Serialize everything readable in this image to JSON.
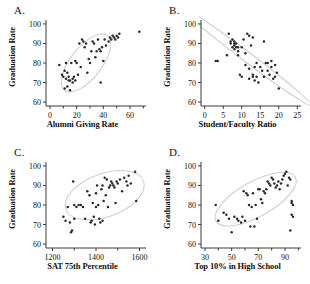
{
  "figure": {
    "width": 310,
    "height": 284,
    "background": "#ffffff",
    "point_color": "#2a2a2a",
    "axis_color": "#3a3a3a",
    "ellipse_color": "#cfcfcf"
  },
  "panels": [
    {
      "letter": "A.",
      "ylabel": "Graduation Rate",
      "xlabel": "Alumni Giving Rate"
    },
    {
      "letter": "B.",
      "ylabel": "Graduation Rate",
      "xlabel": "Student/Faculty Ratio"
    },
    {
      "letter": "C.",
      "ylabel": "Graduation Rate",
      "xlabel": "SAT 75th Percentile"
    },
    {
      "letter": "D.",
      "ylabel": "Graduation Rate",
      "xlabel": "Top 10% in High School"
    }
  ],
  "chart_data": [
    {
      "panel": "A",
      "type": "scatter",
      "title": "A.",
      "xlabel": "Alumni Giving Rate",
      "ylabel": "Graduation Rate",
      "xlim": [
        -3,
        72
      ],
      "ylim": [
        58,
        102
      ],
      "xticks": [
        0,
        20,
        40,
        60
      ],
      "xminorticks": [
        10,
        30,
        50,
        70
      ],
      "yticks": [
        60,
        70,
        80,
        90,
        100
      ],
      "grid": false,
      "legend": null,
      "annotation": "light gray confidence ellipse oriented positively",
      "ellipse": {
        "cx": 27,
        "cy": 80,
        "rx": 26,
        "ry": 8,
        "angle": -52
      },
      "x": [
        7,
        9,
        10,
        11,
        11,
        12,
        12,
        13,
        13,
        14,
        14,
        15,
        15,
        16,
        17,
        17,
        18,
        19,
        19,
        20,
        21,
        22,
        23,
        24,
        25,
        26,
        27,
        28,
        29,
        30,
        31,
        32,
        33,
        34,
        35,
        36,
        37,
        38,
        38,
        39,
        40,
        41,
        42,
        44,
        45,
        46,
        47,
        48,
        49,
        50,
        51,
        52,
        67
      ],
      "y": [
        79,
        74,
        73,
        76,
        67,
        80,
        72,
        75,
        68,
        73,
        71,
        71,
        66,
        80,
        72,
        70,
        73,
        71,
        81,
        80,
        74,
        90,
        78,
        92,
        91,
        88,
        90,
        75,
        82,
        80,
        86,
        91,
        90,
        83,
        86,
        92,
        87,
        86,
        70,
        88,
        81,
        92,
        89,
        91,
        93,
        92,
        94,
        93,
        92,
        94,
        93,
        95,
        96
      ]
    },
    {
      "panel": "B",
      "type": "scatter",
      "title": "B.",
      "xlabel": "Student/Faculty Ratio",
      "ylabel": "Graduation Rate",
      "xlim": [
        -1,
        26
      ],
      "ylim": [
        58,
        102
      ],
      "xticks": [
        0,
        5,
        10,
        15,
        20,
        25
      ],
      "yticks": [
        60,
        70,
        80,
        90,
        100
      ],
      "grid": false,
      "legend": null,
      "annotation": "narrow light gray ellipse with strong negative slope",
      "ellipse": {
        "cx": 11.5,
        "cy": 83,
        "rx": 22,
        "ry": 2.5,
        "angle": 37
      },
      "x": [
        3,
        3.5,
        6,
        6.5,
        7,
        7,
        7.5,
        7.5,
        8,
        8,
        8,
        8,
        8.5,
        8.5,
        9,
        9,
        9,
        9.5,
        10,
        10,
        10.5,
        11,
        11,
        11.5,
        12,
        12,
        12,
        12.5,
        13,
        13,
        13,
        13.5,
        13.5,
        14,
        14,
        14.5,
        15,
        15.5,
        16,
        16,
        16.5,
        17,
        17,
        17.5,
        18,
        18,
        18.5,
        19,
        19,
        19.5,
        20
      ],
      "y": [
        81,
        81,
        84,
        95,
        91,
        90,
        92,
        88,
        91,
        90,
        89,
        87,
        90,
        88,
        88,
        86,
        84,
        74,
        88,
        73,
        92,
        85,
        79,
        95,
        94,
        77,
        72,
        89,
        93,
        74,
        73,
        78,
        71,
        80,
        73,
        70,
        78,
        76,
        91,
        73,
        80,
        80,
        76,
        74,
        81,
        78,
        72,
        79,
        73,
        75,
        67
      ]
    },
    {
      "panel": "C",
      "type": "scatter",
      "title": "C.",
      "xlabel": "SAT 75th Percentile",
      "ylabel": "Graduation Rate",
      "xlim": [
        1170,
        1630
      ],
      "ylim": [
        58,
        102
      ],
      "xticks": [
        1200,
        1400,
        1600
      ],
      "xminorticks": [
        1300,
        1500
      ],
      "yticks": [
        60,
        70,
        80,
        90,
        100
      ],
      "grid": false,
      "legend": null,
      "annotation": "broad light gray ellipse, positive slope, extends past right edge",
      "ellipse": {
        "cx": 1440,
        "cy": 85,
        "rx": 190,
        "ry": 11,
        "angle": -20
      },
      "x": [
        1250,
        1260,
        1270,
        1280,
        1285,
        1290,
        1295,
        1300,
        1300,
        1310,
        1320,
        1330,
        1340,
        1350,
        1360,
        1370,
        1375,
        1380,
        1385,
        1390,
        1395,
        1400,
        1400,
        1405,
        1410,
        1415,
        1420,
        1425,
        1430,
        1430,
        1435,
        1440,
        1445,
        1450,
        1455,
        1460,
        1465,
        1470,
        1475,
        1480,
        1485,
        1490,
        1495,
        1500,
        1510,
        1520,
        1530,
        1540,
        1545,
        1550,
        1560,
        1580,
        1585
      ],
      "y": [
        74,
        72,
        79,
        71,
        66,
        67,
        92,
        80,
        73,
        79,
        80,
        80,
        79,
        73,
        87,
        85,
        71,
        72,
        81,
        74,
        70,
        86,
        79,
        90,
        80,
        73,
        71,
        88,
        90,
        72,
        82,
        94,
        85,
        93,
        79,
        89,
        90,
        92,
        91,
        90,
        89,
        81,
        92,
        91,
        93,
        87,
        94,
        92,
        90,
        95,
        91,
        97,
        82
      ]
    },
    {
      "panel": "D",
      "type": "scatter",
      "title": "D.",
      "xlabel": "Top 10% in High School",
      "ylabel": "Graduation Rate",
      "xlim": [
        27,
        102
      ],
      "ylim": [
        58,
        102
      ],
      "xticks": [
        30,
        50,
        70,
        90
      ],
      "xminorticks": [
        40,
        60,
        80,
        100
      ],
      "yticks": [
        60,
        70,
        80,
        90,
        100
      ],
      "grid": false,
      "legend": null,
      "annotation": "light gray ellipse with positive slope; vertical outlier column near x=95",
      "ellipse": {
        "cx": 68,
        "cy": 83,
        "rx": 34,
        "ry": 9,
        "angle": -29
      },
      "x": [
        38,
        40,
        44,
        46,
        48,
        50,
        52,
        54,
        55,
        57,
        58,
        59,
        60,
        61,
        62,
        63,
        64,
        65,
        66,
        67,
        68,
        69,
        70,
        71,
        72,
        73,
        74,
        75,
        76,
        77,
        78,
        79,
        80,
        81,
        82,
        83,
        84,
        85,
        86,
        87,
        88,
        89,
        90,
        91,
        92,
        93,
        94,
        94,
        95,
        95,
        95,
        96,
        96
      ],
      "y": [
        80,
        72,
        76,
        75,
        73,
        66,
        74,
        73,
        72,
        71,
        74,
        87,
        72,
        86,
        85,
        80,
        69,
        79,
        86,
        69,
        80,
        73,
        88,
        88,
        83,
        81,
        87,
        86,
        88,
        92,
        91,
        90,
        94,
        93,
        91,
        89,
        90,
        92,
        88,
        91,
        93,
        95,
        96,
        97,
        90,
        94,
        93,
        67,
        82,
        81,
        75,
        80,
        74
      ]
    }
  ]
}
